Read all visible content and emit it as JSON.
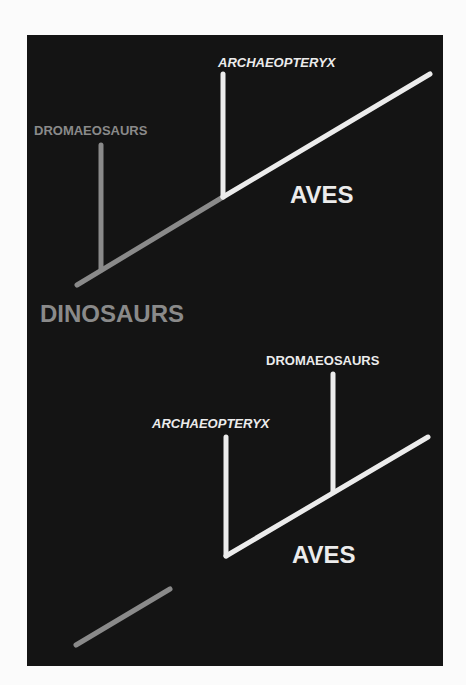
{
  "colors": {
    "background": "#fbfbfb",
    "panel": "#141414",
    "white": "#ececec",
    "gray": "#8a8a8a"
  },
  "top_diagram": {
    "labels": {
      "archaeopteryx": "ARCHAEOPTERYX",
      "dromaeosaurs": "DROMAEOSAURS",
      "aves": "AVES",
      "dinosaurs": "DINOSAURS"
    }
  },
  "bottom_diagram": {
    "labels": {
      "dromaeosaurs": "DROMAEOSAURS",
      "archaeopteryx": "ARCHAEOPTERYX",
      "aves": "AVES"
    }
  }
}
